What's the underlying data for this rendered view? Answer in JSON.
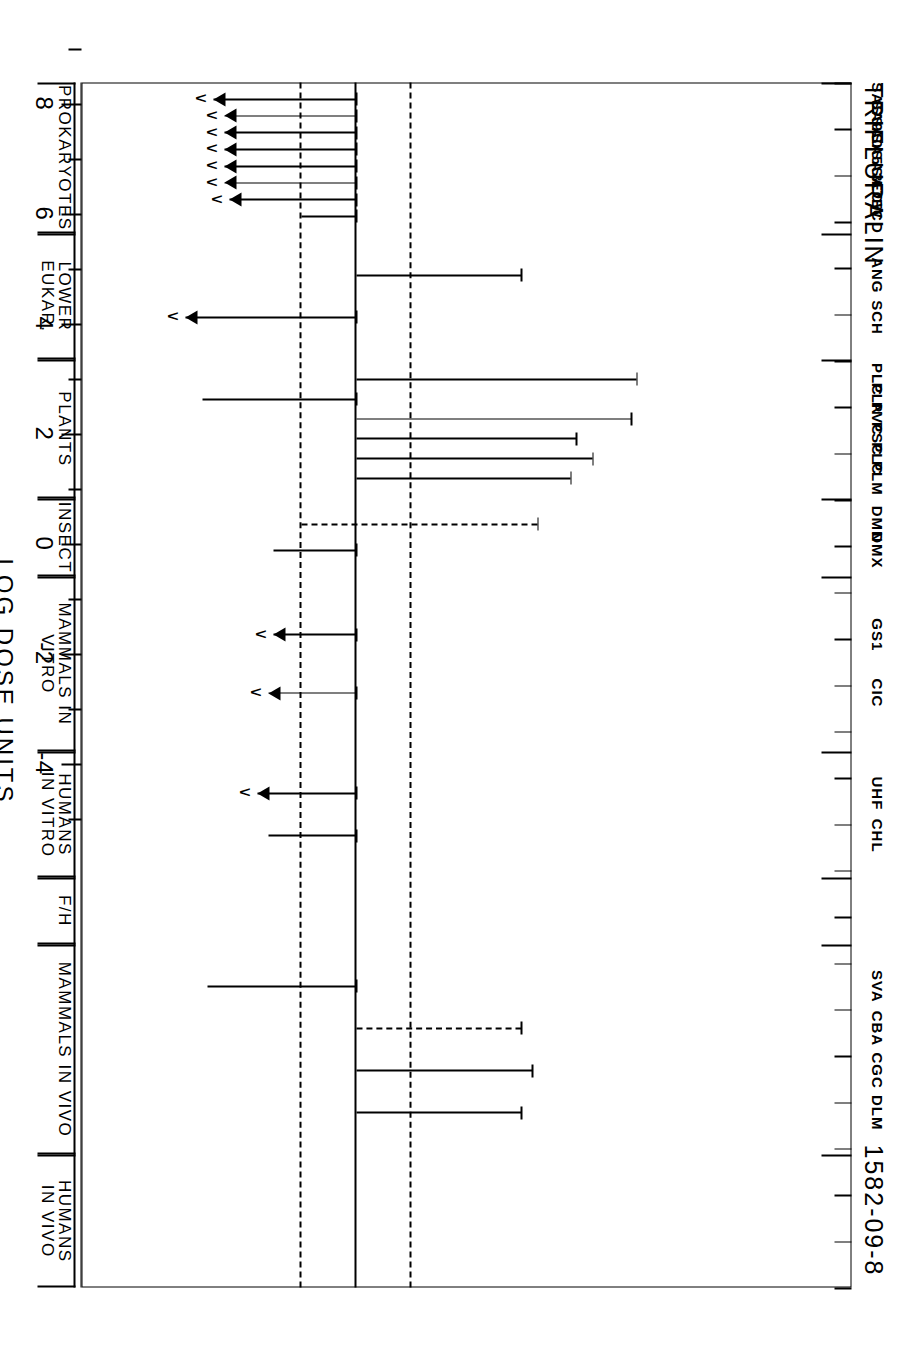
{
  "figure": {
    "title": "TRIFLURALIN",
    "cas_number": "1582-09-8",
    "axis_title": "LOG DOSE UNITS"
  },
  "chart_data": {
    "type": "bar",
    "title": "TRIFLURALIN",
    "subtitle": "1582-09-8",
    "xlabel": "",
    "ylabel": "LOG DOSE UNITS",
    "ylim": [
      9,
      -5
    ],
    "y_ticks": [
      8,
      7,
      6,
      5,
      4,
      3,
      2,
      1,
      0,
      -1,
      -2,
      -3,
      -4
    ],
    "y_tick_labels": [
      "8",
      "",
      "6",
      "",
      "4",
      "",
      "2",
      "",
      "0",
      "",
      "-2",
      "",
      "-4"
    ],
    "grid": false,
    "reference_lines": [
      1,
      0,
      -1
    ],
    "legend": "none",
    "orientation": "horizontal-ranges",
    "note": "Each entry is a horizontal range bar spanning from a low to a high log-dose value; arrows denote open-ended (less-than) results.",
    "groups": [
      {
        "name": "PROKARYOTES",
        "entries": [
          {
            "code": "SAS",
            "low": -2.6,
            "high": 0.0,
            "arrow": "right",
            "lt": true
          },
          {
            "code": "SA9",
            "low": -2.4,
            "high": 0.0,
            "arrow": "right",
            "lt": true
          },
          {
            "code": "SA0",
            "low": -2.4,
            "high": 0.0,
            "arrow": "right",
            "lt": true
          },
          {
            "code": "SA5",
            "low": -2.4,
            "high": 0.0,
            "arrow": "right",
            "lt": true
          },
          {
            "code": "SA3",
            "low": -2.4,
            "high": 0.0,
            "arrow": "right",
            "lt": true
          },
          {
            "code": "SA7",
            "low": -2.4,
            "high": 0.0,
            "arrow": "right",
            "lt": true
          },
          {
            "code": "ECW",
            "low": -2.3,
            "high": 0.0,
            "arrow": "right",
            "lt": true
          },
          {
            "code": "ECD",
            "low": -1.0,
            "high": 0.0,
            "arrow": "none",
            "lt": false
          }
        ]
      },
      {
        "name": "LOWER EUKAR.",
        "entries": [
          {
            "code": "ANG",
            "low": 0.0,
            "high": 3.0,
            "arrow": "none",
            "lt": false
          },
          {
            "code": "SCH",
            "low": -3.1,
            "high": 0.0,
            "arrow": "right",
            "lt": true
          }
        ]
      },
      {
        "name": "PLANTS",
        "entries": [
          {
            "code": "PLC",
            "low": 0.0,
            "high": 5.1,
            "arrow": "none",
            "lt": false
          },
          {
            "code": "PLN",
            "low": -2.8,
            "high": 0.0,
            "arrow": "none",
            "lt": false
          },
          {
            "code": "PVC",
            "low": 0.0,
            "high": 5.0,
            "arrow": "none",
            "lt": false
          },
          {
            "code": "PSC",
            "low": 0.0,
            "high": 4.0,
            "arrow": "none",
            "lt": false
          },
          {
            "code": "PLC2",
            "low": 0.0,
            "high": 4.3,
            "arrow": "none",
            "lt": false
          },
          {
            "code": "PLM",
            "low": 0.0,
            "high": 3.9,
            "arrow": "none",
            "lt": false
          }
        ]
      },
      {
        "name": "INSECT",
        "entries": [
          {
            "code": "DMN",
            "low": -1.0,
            "high": 3.3,
            "arrow": "none",
            "lt": false,
            "dashed_tail": true
          },
          {
            "code": "DMX",
            "low": -1.5,
            "high": 0.0,
            "arrow": "none",
            "lt": false
          }
        ]
      },
      {
        "name": "MAMMALS IN VITRO",
        "entries": [
          {
            "code": "GS1",
            "low": -1.5,
            "high": 0.0,
            "arrow": "right",
            "lt": true
          },
          {
            "code": "CIC",
            "low": -1.6,
            "high": 0.0,
            "arrow": "right",
            "lt": true
          }
        ]
      },
      {
        "name": "HUMANS\nIN VITRO",
        "entries": [
          {
            "code": "UHF",
            "low": -1.8,
            "high": 0.0,
            "arrow": "right",
            "lt": true
          },
          {
            "code": "CHL",
            "low": -1.6,
            "high": 0.0,
            "arrow": "none",
            "lt": false
          }
        ]
      },
      {
        "name": "F/H",
        "entries": []
      },
      {
        "name": "MAMMALS IN VIVO",
        "entries": [
          {
            "code": "SVA",
            "low": -2.7,
            "high": 0.0,
            "arrow": "none",
            "lt": false
          },
          {
            "code": "CBA",
            "low": 0.0,
            "high": 3.0,
            "arrow": "none",
            "lt": false,
            "dashed_tail": true
          },
          {
            "code": "CGC",
            "low": 0.0,
            "high": 3.2,
            "arrow": "none",
            "lt": false
          },
          {
            "code": "DLM",
            "low": 0.0,
            "high": 3.0,
            "arrow": "none",
            "lt": false
          }
        ]
      },
      {
        "name": "HUMANS\nIN VIVO",
        "entries": []
      }
    ]
  },
  "group_labels": [
    {
      "label": "PROKARYOTES"
    },
    {
      "label": "LOWER EUKAR."
    },
    {
      "label": "PLANTS"
    },
    {
      "label": "INSECT"
    },
    {
      "label": "MAMMALS IN VITRO"
    },
    {
      "label": "HUMANS\nIN VITRO"
    },
    {
      "label": "F/H"
    },
    {
      "label": "MAMMALS IN VIVO"
    },
    {
      "label": "HUMANS\nIN VIVO"
    }
  ],
  "assay_codes": [
    "SAS",
    "SA9",
    "SA0",
    "SA5",
    "SA3",
    "SA7",
    "ECW",
    "ECD",
    "ANG",
    "SCH",
    "PLC",
    "PLN",
    "PVC",
    "PSC",
    "PLC",
    "PLM",
    "DMN",
    "DMX",
    "GS1",
    "CIC",
    "UHF",
    "CHL",
    "SVA",
    "CBA",
    "CGC",
    "DLM"
  ],
  "colors": {
    "ink": "#000000",
    "paper": "#ffffff"
  }
}
